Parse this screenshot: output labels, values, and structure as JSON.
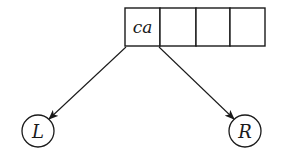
{
  "diagram": {
    "type": "tree-node-array",
    "array": {
      "cells": [
        {
          "label": "ca"
        },
        {
          "label": ""
        },
        {
          "label": ""
        },
        {
          "label": ""
        }
      ]
    },
    "children": [
      {
        "label": "L",
        "side": "left"
      },
      {
        "label": "R",
        "side": "right"
      }
    ],
    "edges": [
      {
        "from": "array.cells.0.left-corner",
        "to": "children.0",
        "arrow": true
      },
      {
        "from": "array.cells.0.right-corner",
        "to": "children.1",
        "arrow": true
      }
    ],
    "colors": {
      "stroke": "#1a1a1a",
      "background": "#ffffff"
    }
  }
}
